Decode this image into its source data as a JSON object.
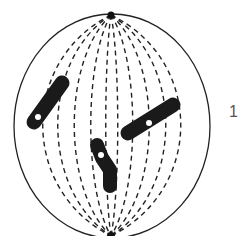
{
  "figure": {
    "label": "1",
    "colors": {
      "outline": "#222222",
      "fiber": "#222222",
      "chromosome": "#1a1a1a",
      "centromere": "#ffffff",
      "label": "#555555"
    },
    "spindle": {
      "cx": 112,
      "cy": 125,
      "rx": 98,
      "ry": 112,
      "top_pole": [
        111,
        15
      ],
      "bottom_pole": [
        111,
        236
      ]
    },
    "chromosomes": [
      {
        "name": "chromosome-left",
        "from": [
          62,
          83
        ],
        "to": [
          33,
          124
        ],
        "centromere": [
          38,
          117
        ]
      },
      {
        "name": "chromosome-right",
        "from": [
          175,
          104
        ],
        "to": [
          126,
          134
        ],
        "centromere": [
          149,
          123
        ]
      },
      {
        "name": "chromosome-center",
        "from": [
          97,
          144
        ],
        "to": [
          110,
          186
        ],
        "centromere": [
          101,
          155
        ]
      }
    ]
  }
}
